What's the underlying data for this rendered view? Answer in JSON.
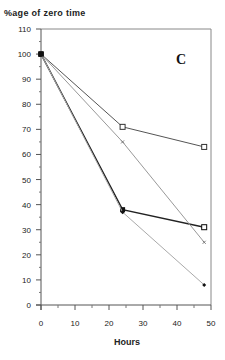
{
  "chart_data": {
    "type": "line",
    "title": "",
    "panel_label": "C",
    "xlabel": "Hours",
    "ylabel": "%age of zero time",
    "xlim": [
      0,
      50
    ],
    "ylim": [
      0,
      110
    ],
    "xticks": [
      0,
      10,
      20,
      30,
      40,
      50
    ],
    "yticks": [
      0,
      10,
      20,
      30,
      40,
      50,
      60,
      70,
      80,
      90,
      100,
      110
    ],
    "grid": false,
    "legend": null,
    "x": [
      0,
      24,
      48
    ],
    "series": [
      {
        "name": "open squares",
        "marker": "open-square",
        "color": "#555555",
        "values": [
          100,
          71,
          63
        ]
      },
      {
        "name": "filled squares",
        "marker": "filled-square",
        "color": "#222222",
        "values": [
          100,
          38,
          31
        ]
      },
      {
        "name": "small cross markers",
        "marker": "cross",
        "color": "#999999",
        "values": [
          100,
          65,
          25
        ]
      },
      {
        "name": "filled diamonds",
        "marker": "filled-diamond",
        "color": "#aaaaaa",
        "values": [
          100,
          37,
          8
        ]
      }
    ]
  }
}
